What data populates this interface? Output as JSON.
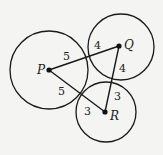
{
  "diagram": {
    "circles": [
      {
        "center": "P",
        "radius": 5
      },
      {
        "center": "Q",
        "radius": 4
      },
      {
        "center": "R",
        "radius": 3
      }
    ],
    "points": {
      "P": {
        "label": "P"
      },
      "Q": {
        "label": "Q"
      },
      "R": {
        "label": "R"
      }
    },
    "segment_labels": {
      "PQ_near_P": "5",
      "PQ_near_Q": "4",
      "QR_near_Q": "4",
      "QR_near_R": "3",
      "PR_near_P": "5",
      "PR_near_R": "3"
    },
    "colors": {
      "stroke": "#1a1a1a",
      "background": "#f4f4f2"
    }
  }
}
